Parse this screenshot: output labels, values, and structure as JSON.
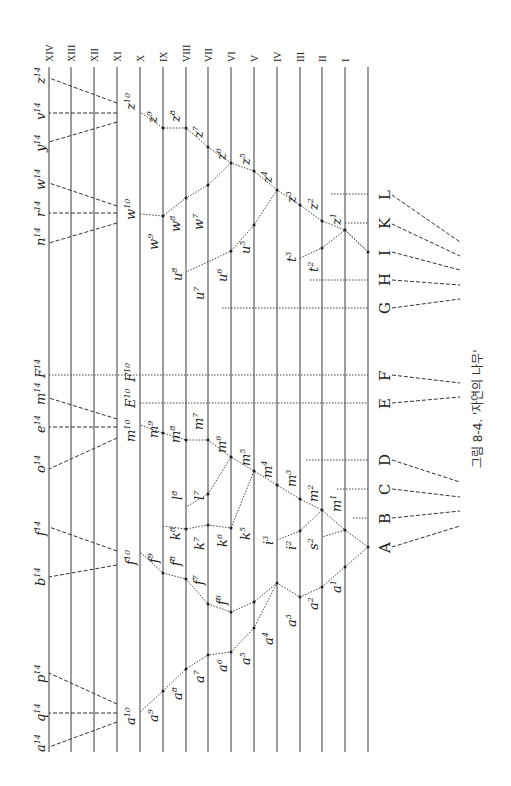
{
  "figure": {
    "caption": "그림 8-4. '자연의 나무'",
    "orientation": "rotated 90° counter-clockwise",
    "generations": [
      "XIV",
      "XIII",
      "XII",
      "XI",
      "X",
      "IX",
      "VIII",
      "VII",
      "VI",
      "V",
      "IV",
      "III",
      "II",
      "I"
    ],
    "ancestral_species": [
      "L",
      "K",
      "I",
      "H",
      "G",
      "F",
      "E",
      "D",
      "C",
      "B",
      "A"
    ],
    "top_descendants": [
      "z14",
      "v14",
      "y14",
      "w14",
      "r14",
      "n14",
      "F14",
      "m14",
      "e14",
      "o14",
      "f14",
      "b14",
      "p14",
      "q14",
      "a14"
    ],
    "generation_10_labels": [
      "z10",
      "w10",
      "F10",
      "E10",
      "m10",
      "f10",
      "a10"
    ],
    "branch_labels": {
      "A_a_lineage": [
        "a1",
        "a2",
        "a3",
        "a4",
        "a5",
        "a6",
        "a7",
        "a8",
        "a9",
        "a10"
      ],
      "A_m_lineage": [
        "m1",
        "m2",
        "m3",
        "m4",
        "m5",
        "m6",
        "m7",
        "m8",
        "m9",
        "m10"
      ],
      "A_f_lineage": [
        "f6",
        "f7",
        "f8",
        "f9",
        "f10"
      ],
      "A_k_lineage": [
        "k5",
        "k6",
        "k7",
        "k8"
      ],
      "A_l_lineage": [
        "l7",
        "l8"
      ],
      "A_i_lineage": [
        "i2",
        "i3"
      ],
      "A_s_lineage": [
        "s2"
      ],
      "I_z_lineage": [
        "z1",
        "z2",
        "z3",
        "z4",
        "z5",
        "z6",
        "z7",
        "z8",
        "z9",
        "z10"
      ],
      "I_w_lineage": [
        "w7",
        "w8",
        "w9",
        "w10"
      ],
      "I_u_lineage": [
        "u5",
        "u6",
        "u7",
        "u8"
      ],
      "I_t_lineage": [
        "t2",
        "t3"
      ]
    }
  },
  "labels": {
    "roman": {
      "XIV": "XIV",
      "XIII": "XIII",
      "XII": "XII",
      "XI": "XI",
      "X": "X",
      "IX": "IX",
      "VIII": "VIII",
      "VII": "VII",
      "VI": "VI",
      "V": "V",
      "IV": "IV",
      "III": "III",
      "II": "II",
      "I": "I"
    },
    "letters": {
      "L": "L",
      "K": "K",
      "I": "I",
      "H": "H",
      "G": "G",
      "F": "F",
      "E": "E",
      "D": "D",
      "C": "C",
      "B": "B",
      "A": "A"
    }
  }
}
